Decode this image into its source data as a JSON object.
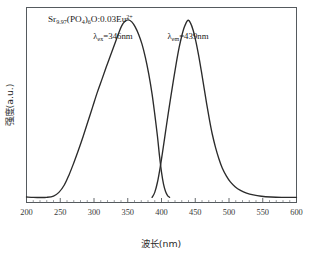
{
  "chart_data": {
    "type": "line",
    "title": "",
    "xlabel": "波长(nm)",
    "ylabel": "强度(a.u.)",
    "xlim": [
      200,
      600
    ],
    "ylim": [
      0,
      1.06
    ],
    "xticks": [
      200,
      250,
      300,
      350,
      400,
      450,
      500,
      550,
      600
    ],
    "xtick_labels": [
      "200",
      "250",
      "300",
      "350",
      "400",
      "450",
      "500",
      "550",
      "600"
    ],
    "yticks": [],
    "ytick_labels": [],
    "grid": false,
    "legend": "none",
    "minor_ticks_per_interval": 5,
    "annotations": {
      "sample_formula": {
        "text": "Sr9.97(PO4)6O:0.03Eu2+",
        "parts": [
          {
            "t": "Sr",
            "style": "normal"
          },
          {
            "t": "9.97",
            "style": "sub"
          },
          {
            "t": "(PO",
            "style": "normal"
          },
          {
            "t": "4",
            "style": "sub"
          },
          {
            "t": ")",
            "style": "normal"
          },
          {
            "t": "6",
            "style": "sub"
          },
          {
            "t": "O:0.03Eu",
            "style": "normal"
          },
          {
            "t": "2+",
            "style": "sup"
          }
        ]
      },
      "excitation_label": {
        "lambda": "λ",
        "subscript": "ex",
        "equals_value": "=346nm",
        "peak_nm": 346
      },
      "emission_label": {
        "lambda": "λ",
        "subscript": "em",
        "equals_value": "=439nm",
        "peak_nm": 439
      }
    },
    "series": [
      {
        "name": "excitation",
        "peak_nm": 346,
        "points": [
          [
            200,
            0.03
          ],
          [
            210,
            0.028
          ],
          [
            220,
            0.027
          ],
          [
            230,
            0.028
          ],
          [
            240,
            0.035
          ],
          [
            248,
            0.055
          ],
          [
            256,
            0.095
          ],
          [
            263,
            0.15
          ],
          [
            270,
            0.215
          ],
          [
            277,
            0.285
          ],
          [
            284,
            0.36
          ],
          [
            291,
            0.44
          ],
          [
            298,
            0.52
          ],
          [
            305,
            0.6
          ],
          [
            312,
            0.672
          ],
          [
            318,
            0.735
          ],
          [
            324,
            0.795
          ],
          [
            330,
            0.855
          ],
          [
            336,
            0.915
          ],
          [
            341,
            0.96
          ],
          [
            346,
            0.985
          ],
          [
            351,
            0.993
          ],
          [
            356,
            0.982
          ],
          [
            361,
            0.955
          ],
          [
            366,
            0.915
          ],
          [
            371,
            0.862
          ],
          [
            376,
            0.79
          ],
          [
            381,
            0.7
          ],
          [
            386,
            0.59
          ],
          [
            390,
            0.48
          ],
          [
            394,
            0.36
          ],
          [
            397,
            0.255
          ],
          [
            400,
            0.165
          ],
          [
            403,
            0.1
          ],
          [
            406,
            0.06
          ],
          [
            409,
            0.038
          ],
          [
            412,
            0.028
          ]
        ]
      },
      {
        "name": "emission",
        "peak_nm": 439,
        "points": [
          [
            386,
            0.028
          ],
          [
            390,
            0.055
          ],
          [
            394,
            0.11
          ],
          [
            398,
            0.19
          ],
          [
            402,
            0.285
          ],
          [
            406,
            0.385
          ],
          [
            410,
            0.485
          ],
          [
            414,
            0.58
          ],
          [
            418,
            0.672
          ],
          [
            422,
            0.76
          ],
          [
            426,
            0.84
          ],
          [
            430,
            0.905
          ],
          [
            434,
            0.955
          ],
          [
            439,
            0.99
          ],
          [
            443,
            0.975
          ],
          [
            447,
            0.935
          ],
          [
            451,
            0.875
          ],
          [
            455,
            0.8
          ],
          [
            459,
            0.715
          ],
          [
            463,
            0.625
          ],
          [
            467,
            0.535
          ],
          [
            471,
            0.45
          ],
          [
            475,
            0.375
          ],
          [
            480,
            0.3
          ],
          [
            485,
            0.238
          ],
          [
            490,
            0.188
          ],
          [
            496,
            0.145
          ],
          [
            502,
            0.112
          ],
          [
            509,
            0.086
          ],
          [
            517,
            0.066
          ],
          [
            526,
            0.051
          ],
          [
            536,
            0.041
          ],
          [
            548,
            0.034
          ],
          [
            562,
            0.03
          ],
          [
            578,
            0.028
          ],
          [
            600,
            0.028
          ]
        ]
      }
    ]
  }
}
